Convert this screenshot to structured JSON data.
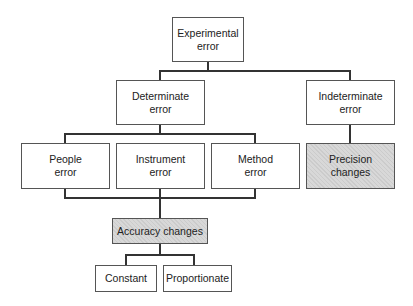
{
  "diagram": {
    "nodes": {
      "experimental": {
        "label": "Experimental\nerror"
      },
      "determinate": {
        "label": "Determinate\nerror"
      },
      "indeterminate": {
        "label": "Indeterminate\nerror"
      },
      "people": {
        "label": "People\nerror"
      },
      "instrument": {
        "label": "Instrument\nerror"
      },
      "method": {
        "label": "Method\nerror"
      },
      "precision": {
        "label": "Precision\nchanges",
        "shaded": true
      },
      "accuracy": {
        "label": "Accuracy changes",
        "shaded": true
      },
      "constant": {
        "label": "Constant"
      },
      "proportionate": {
        "label": "Proportionate"
      }
    },
    "edges": [
      [
        "experimental",
        "determinate"
      ],
      [
        "experimental",
        "indeterminate"
      ],
      [
        "determinate",
        "people"
      ],
      [
        "determinate",
        "instrument"
      ],
      [
        "determinate",
        "method"
      ],
      [
        "indeterminate",
        "precision"
      ],
      [
        "people",
        "accuracy"
      ],
      [
        "instrument",
        "accuracy"
      ],
      [
        "method",
        "accuracy"
      ],
      [
        "accuracy",
        "constant"
      ],
      [
        "accuracy",
        "proportionate"
      ]
    ],
    "colors": {
      "line": "#333333",
      "border": "#555555",
      "shade": "#d8d8d8"
    }
  }
}
